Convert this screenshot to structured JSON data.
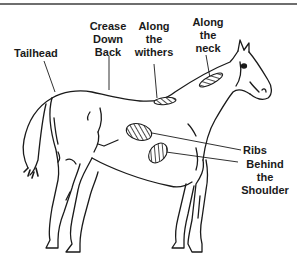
{
  "diagram": {
    "labels": {
      "tailhead": "Tailhead",
      "crease_down_back": "Crease\nDown\nBack",
      "along_withers": "Along\nthe\nwithers",
      "along_neck": "Along\nthe\nneck",
      "ribs": "Ribs",
      "behind_shoulder": "Behind\nthe\nShoulder"
    },
    "colors": {
      "line": "#1a1a1a",
      "background": "#ffffff",
      "border": "#6e6e6e"
    }
  }
}
